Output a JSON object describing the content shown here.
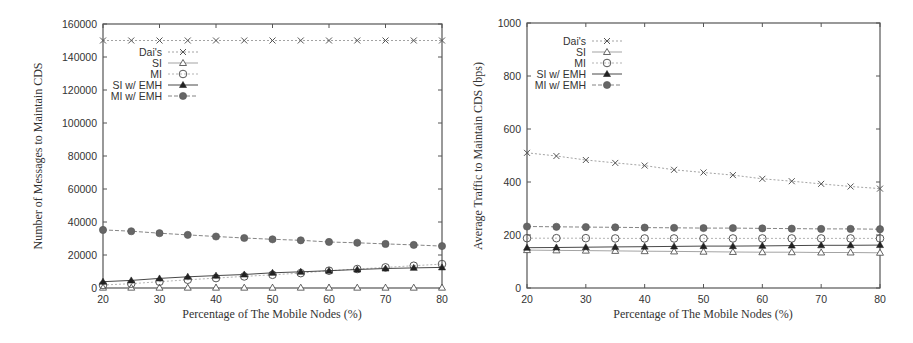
{
  "chart_data": [
    {
      "type": "line",
      "title": "",
      "xlabel": "Percentage of The Mobile Nodes (%)",
      "ylabel": "Number of Messages to Maintain CDS",
      "xlim": [
        20,
        80
      ],
      "ylim": [
        0,
        160000
      ],
      "x_ticks": [
        20,
        30,
        40,
        50,
        60,
        70,
        80
      ],
      "y_ticks": [
        0,
        20000,
        40000,
        60000,
        80000,
        100000,
        120000,
        140000,
        160000
      ],
      "grid": false,
      "legend_position": "upper-left",
      "x": [
        20,
        25,
        30,
        35,
        40,
        45,
        50,
        55,
        60,
        65,
        70,
        75,
        80
      ],
      "series": [
        {
          "name": "Dai's",
          "marker": "x",
          "values": [
            150000,
            150000,
            150000,
            150000,
            150000,
            150000,
            150000,
            150000,
            150000,
            150000,
            150000,
            150000,
            150000
          ]
        },
        {
          "name": "SI",
          "marker": "triangle-open",
          "values": [
            200,
            200,
            200,
            200,
            200,
            200,
            200,
            200,
            200,
            200,
            200,
            200,
            200
          ]
        },
        {
          "name": "MI",
          "marker": "circle-open",
          "values": [
            1800,
            2600,
            3800,
            5000,
            6000,
            7000,
            8000,
            9000,
            10500,
            11500,
            12500,
            13500,
            14500
          ]
        },
        {
          "name": "SI w/ EMH",
          "marker": "triangle-filled",
          "values": [
            3800,
            4600,
            5800,
            6800,
            7500,
            8200,
            9200,
            9800,
            10500,
            11200,
            11800,
            12200,
            12500
          ]
        },
        {
          "name": "MI w/ EMH",
          "marker": "circle-filled",
          "values": [
            35200,
            34400,
            33200,
            32200,
            31200,
            30300,
            29500,
            28900,
            27900,
            27400,
            26700,
            26100,
            25400
          ]
        }
      ]
    },
    {
      "type": "line",
      "title": "",
      "xlabel": "Percentage of The Mobile Nodes (%)",
      "ylabel": "Average Traffic to Maintain CDS (bps)",
      "xlim": [
        20,
        80
      ],
      "ylim": [
        0,
        1000
      ],
      "x_ticks": [
        20,
        30,
        40,
        50,
        60,
        70,
        80
      ],
      "y_ticks": [
        0,
        200,
        400,
        600,
        800,
        1000
      ],
      "grid": false,
      "legend_position": "upper-left",
      "x": [
        20,
        25,
        30,
        35,
        40,
        45,
        50,
        55,
        60,
        65,
        70,
        75,
        80
      ],
      "series": [
        {
          "name": "Dai's",
          "marker": "x",
          "values": [
            510,
            498,
            483,
            472,
            462,
            446,
            436,
            426,
            412,
            403,
            393,
            383,
            375
          ]
        },
        {
          "name": "SI",
          "marker": "triangle-open",
          "values": [
            143,
            142,
            141,
            140,
            139,
            138,
            137,
            136,
            135,
            135,
            134,
            134,
            133
          ]
        },
        {
          "name": "MI",
          "marker": "circle-open",
          "values": [
            188,
            188,
            188,
            187,
            187,
            187,
            187,
            187,
            187,
            187,
            187,
            187,
            187
          ]
        },
        {
          "name": "SI w/ EMH",
          "marker": "triangle-filled",
          "values": [
            152,
            153,
            154,
            155,
            156,
            157,
            158,
            158,
            159,
            160,
            161,
            161,
            162
          ]
        },
        {
          "name": "MI w/ EMH",
          "marker": "circle-filled",
          "values": [
            232,
            231,
            230,
            229,
            228,
            227,
            226,
            226,
            225,
            224,
            223,
            223,
            222
          ]
        }
      ]
    }
  ]
}
